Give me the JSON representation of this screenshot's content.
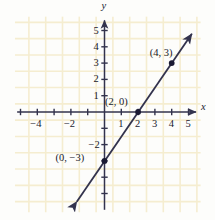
{
  "figure": {
    "kind": "coordinate-plane-line-graph",
    "axis_labels": {
      "x": "x",
      "y": "y"
    },
    "colors": {
      "grid": "#f5edd0",
      "axis": "#33334d",
      "line": "#33334d",
      "point": "#1a1a33",
      "text": "#1a1a2e",
      "background": "#fdfdfb"
    }
  },
  "chart_data": {
    "type": "line",
    "title": "",
    "xlabel": "x",
    "ylabel": "y",
    "xlim": [
      -5.5,
      5.8
    ],
    "ylim": [
      -6.2,
      5.9
    ],
    "grid": true,
    "legend": "none",
    "series": [
      {
        "name": "line",
        "equation": "y = 1.5x - 3",
        "slope": 1.5,
        "y_intercept": -3,
        "x_intercept": 2,
        "arrows": "both",
        "endpoints": [
          [
            -1.65,
            -5.5
          ],
          [
            5.2,
            4.8
          ]
        ],
        "points": [
          {
            "x": 0,
            "y": -3,
            "label": "(0, −3)"
          },
          {
            "x": 2,
            "y": 0,
            "label": "(2, 0)"
          },
          {
            "x": 4,
            "y": 3,
            "label": "(4, 3)"
          }
        ]
      }
    ],
    "x_ticks": [
      -5,
      -4,
      -3,
      -2,
      -1,
      1,
      2,
      3,
      4,
      5
    ],
    "x_tick_labels": [
      {
        "value": -4,
        "text": "−4"
      },
      {
        "value": -2,
        "text": "−2"
      },
      {
        "value": 1,
        "text": "1"
      },
      {
        "value": 2,
        "text": "2"
      },
      {
        "value": 3,
        "text": "3"
      },
      {
        "value": 4,
        "text": "4"
      },
      {
        "value": 5,
        "text": "5"
      }
    ],
    "y_ticks": [
      -5,
      -4,
      -3,
      -2,
      -1,
      1,
      2,
      3,
      4,
      5
    ],
    "y_tick_labels": [
      {
        "value": 5,
        "text": "5"
      },
      {
        "value": 4,
        "text": "4"
      },
      {
        "value": 3,
        "text": "3"
      },
      {
        "value": 2,
        "text": "2"
      },
      {
        "value": 1,
        "text": "1"
      },
      {
        "value": -2,
        "text": "−2"
      }
    ],
    "point_labels": [
      {
        "text": "(4, 3)",
        "anchor_x": 4,
        "anchor_y": 3
      },
      {
        "text": "(2, 0)",
        "anchor_x": 2,
        "anchor_y": 0
      },
      {
        "text": "(0, −3)",
        "anchor_x": 0,
        "anchor_y": -3
      }
    ]
  }
}
